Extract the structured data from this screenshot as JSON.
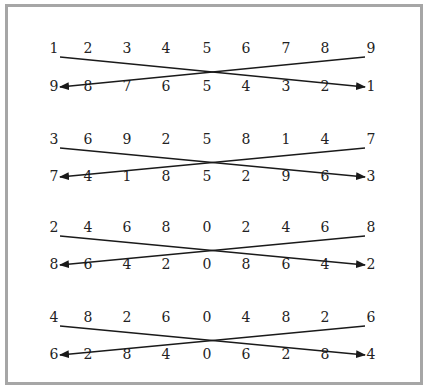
{
  "colors": {
    "frame_border": "#a6a6a6",
    "line": "#1a1a1a",
    "text": "#222222",
    "background": "#ffffff"
  },
  "layout": {
    "column_x": [
      54,
      88,
      127,
      166,
      207,
      246,
      286,
      325,
      371
    ],
    "row_groups_y": [
      {
        "top": 53,
        "bottom": 91
      },
      {
        "top": 144,
        "bottom": 181
      },
      {
        "top": 232,
        "bottom": 269
      },
      {
        "top": 322,
        "bottom": 359
      }
    ]
  },
  "groups": [
    {
      "top_row": [
        "1",
        "2",
        "3",
        "4",
        "5",
        "6",
        "7",
        "8",
        "9"
      ],
      "bottom_row": [
        "9",
        "8",
        "7",
        "6",
        "5",
        "4",
        "3",
        "2",
        "1"
      ]
    },
    {
      "top_row": [
        "3",
        "6",
        "9",
        "2",
        "5",
        "8",
        "1",
        "4",
        "7"
      ],
      "bottom_row": [
        "7",
        "4",
        "1",
        "8",
        "5",
        "2",
        "9",
        "6",
        "3"
      ]
    },
    {
      "top_row": [
        "2",
        "4",
        "6",
        "8",
        "0",
        "2",
        "4",
        "6",
        "8"
      ],
      "bottom_row": [
        "8",
        "6",
        "4",
        "2",
        "0",
        "8",
        "6",
        "4",
        "2"
      ]
    },
    {
      "top_row": [
        "4",
        "8",
        "2",
        "6",
        "0",
        "4",
        "8",
        "2",
        "6"
      ],
      "bottom_row": [
        "6",
        "2",
        "8",
        "4",
        "0",
        "6",
        "2",
        "8",
        "4"
      ]
    }
  ],
  "arrows": [
    {
      "description": "Line from top-left number to bottom-right number, arrowhead pointing at bottom-right"
    },
    {
      "description": "Line from top-right number to bottom-left number, arrowhead pointing at bottom-left"
    }
  ]
}
